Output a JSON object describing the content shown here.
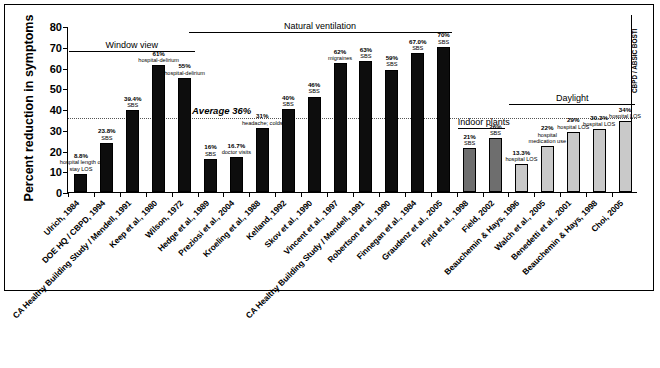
{
  "chart_data": {
    "type": "bar",
    "title": "",
    "xlabel": "",
    "ylabel": "Percent reduction in symptoms",
    "ylim": [
      0,
      80
    ],
    "yticks": [
      0,
      10,
      20,
      30,
      40,
      50,
      60,
      70,
      80
    ],
    "grid": false,
    "legend": "none",
    "average_line": {
      "value": 36,
      "label": "Average 36%"
    },
    "group_headers": [
      {
        "label": "Window view",
        "from_index": 0,
        "to_index": 4
      },
      {
        "label": "Natural ventilation",
        "from_index": 5,
        "to_index": 14
      },
      {
        "label": "Indoor plants",
        "from_index": 15,
        "to_index": 16
      },
      {
        "label": "Daylight",
        "from_index": 17,
        "to_index": 21
      },
      {
        "label": "CBPD / ABSIC BOSTI",
        "vertical": true
      }
    ],
    "categories": [
      "Ulrich, 1984",
      "DOE HQ / CBPD, 1994",
      "CA Healthy Building Study / Mendell, 1991",
      "Keep et al., 1980",
      "Wilson, 1972",
      "Hedge et al., 1989",
      "Preziosi et al., 2004",
      "Kroeling et al., 1988",
      "Kelland, 1992",
      "Skov et al., 1990",
      "Vincent et al., 1997",
      "CA Healthy Building Study / Mendell, 1991",
      "Robertson et al., 1990",
      "Finnegan et al., 1984",
      "Graudenz et al., 2005",
      "Fjeld et al., 1998",
      "Field, 2002",
      "Beauchemin & Hays, 1996",
      "Walch et al., 2005",
      "Benedetti et al., 2001",
      "Beauchemin & Hays, 1998",
      "Choi, 2005"
    ],
    "values": [
      8.8,
      23.8,
      39.4,
      61,
      55,
      16,
      16.7,
      31,
      40,
      46,
      62,
      63,
      59,
      67.0,
      70,
      21,
      26,
      13.3,
      22,
      29,
      30.3,
      34
    ],
    "value_labels": [
      "8.8%",
      "23.8%",
      "39.4%",
      "61%",
      "55%",
      "16%",
      "16.7%",
      "31%",
      "40%",
      "46%",
      "62%",
      "63%",
      "59%",
      "67.0%",
      "70%",
      "21%",
      "26%",
      "13.3%",
      "22%",
      "29%",
      "30.3%",
      "34%"
    ],
    "outcome_labels": [
      "hospital length of stay LOS",
      "SBS",
      "SBS",
      "hospital-delirium",
      "hospital-delirium",
      "SBS",
      "doctor visits",
      "headache; colds",
      "SBS",
      "SBS",
      "migraines",
      "SBS",
      "SBS",
      "SBS",
      "SBS",
      "SBS",
      "SBS",
      "hospital LOS",
      "hospital medication use",
      "hospital LOS",
      "hospital LOS",
      "hospital LOS"
    ],
    "bar_shades": [
      "dark",
      "dark",
      "dark",
      "dark",
      "dark",
      "dark",
      "dark",
      "dark",
      "dark",
      "dark",
      "dark",
      "dark",
      "dark",
      "dark",
      "dark",
      "mid",
      "mid",
      "light",
      "light",
      "light",
      "light",
      "light"
    ],
    "colors": {
      "dark": "#0d0d0d",
      "mid": "#6e6e6e",
      "light": "#c9c9c9",
      "axis": "#000000",
      "average_line": "#555555"
    }
  }
}
